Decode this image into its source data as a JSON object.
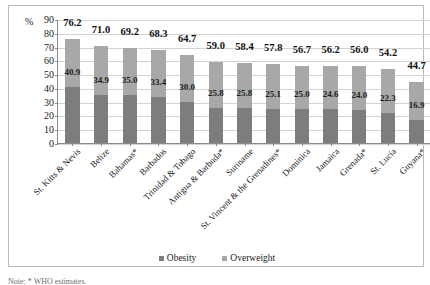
{
  "chart_data": {
    "type": "bar",
    "title": "",
    "subtitle": "",
    "xlabel": "",
    "ylabel": "%",
    "ylim": [
      0,
      90
    ],
    "ytick_step": 10,
    "yticks": [
      90,
      80,
      70,
      60,
      50,
      40,
      30,
      20,
      10,
      0
    ],
    "grid": true,
    "bar_style": "overlaid",
    "legend_position": "bottom-center",
    "categories": [
      "St. Kitts & Nevis",
      "Belize",
      "Bahamas*",
      "Barbados",
      "Trinidad & Tobago",
      "Antigua & Barbuda*",
      "Suriname",
      "St. Vincent & the Grenadines*",
      "Dominica",
      "Jamaica",
      "Grenada*",
      "St. Lucia",
      "Guyana*"
    ],
    "series": [
      {
        "name": "Overweight",
        "color": "#a8a8a8",
        "values": [
          76.2,
          71.0,
          69.2,
          68.3,
          64.7,
          59.0,
          58.4,
          57.8,
          56.7,
          56.2,
          56.0,
          54.2,
          44.7
        ]
      },
      {
        "name": "Obesity",
        "color": "#7d7d7d",
        "values": [
          40.9,
          34.9,
          35.0,
          33.4,
          30.0,
          25.8,
          25.8,
          25.1,
          25.0,
          24.6,
          24.0,
          22.3,
          16.9
        ]
      }
    ]
  },
  "legend": {
    "items": [
      {
        "label": "Obesity"
      },
      {
        "label": "Overweight"
      }
    ]
  },
  "footnote": {
    "text": "Note: * WHO estimates."
  }
}
